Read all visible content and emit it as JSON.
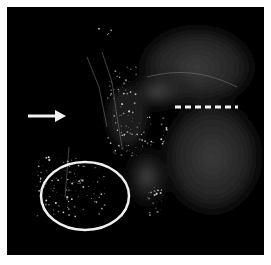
{
  "figure": {
    "annotations": [
      {
        "type": "arrow",
        "direction": "right",
        "color": "#f2f2f2"
      },
      {
        "type": "dashed-line",
        "color": "#f2f2f2"
      },
      {
        "type": "ellipse",
        "color": "#f0f0f0"
      }
    ]
  }
}
